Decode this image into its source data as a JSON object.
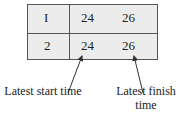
{
  "table": {
    "rows": [
      {
        "id": "I",
        "start": "24",
        "finish": "26"
      },
      {
        "id": "2",
        "start": "24",
        "finish": "26"
      }
    ]
  },
  "annotations": {
    "start_label": "Latest start time",
    "finish_label": "Latest finish time"
  }
}
